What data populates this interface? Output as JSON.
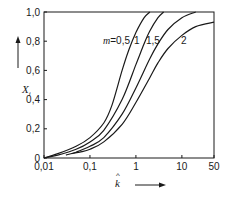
{
  "chart_data": {
    "type": "line",
    "title": "",
    "xlabel": "k̂",
    "ylabel": "X_i",
    "xscale": "log",
    "xlim": [
      0.01,
      50
    ],
    "ylim": [
      0,
      1.0
    ],
    "grid": false,
    "x_ticks": [
      "0,01",
      "0,1",
      "1",
      "10",
      "50"
    ],
    "y_ticks": [
      "0",
      "0,2",
      "0,4",
      "0,6",
      "0,8",
      "1,0"
    ],
    "legend": {
      "position": "inline",
      "prefix": "m ="
    },
    "series": [
      {
        "name": "m = 0,5",
        "label": "0,5",
        "x": [
          0.01,
          0.02,
          0.05,
          0.1,
          0.2,
          0.3,
          0.5,
          0.7,
          1.0,
          1.5,
          2.0
        ],
        "y": [
          0.0,
          0.03,
          0.08,
          0.14,
          0.24,
          0.36,
          0.6,
          0.74,
          0.86,
          0.96,
          1.0
        ]
      },
      {
        "name": "m = 1",
        "label": "1",
        "x": [
          0.01,
          0.02,
          0.05,
          0.1,
          0.2,
          0.5,
          1.0,
          1.5,
          2.0,
          3.0,
          4.0
        ],
        "y": [
          0.0,
          0.02,
          0.06,
          0.11,
          0.19,
          0.4,
          0.64,
          0.78,
          0.87,
          0.96,
          1.0
        ]
      },
      {
        "name": "m = 1,5",
        "label": "1,5",
        "x": [
          0.03,
          0.05,
          0.1,
          0.2,
          0.5,
          1.0,
          2.0,
          3.0,
          5.0,
          10.0,
          20.0
        ],
        "y": [
          0.02,
          0.04,
          0.08,
          0.14,
          0.3,
          0.48,
          0.68,
          0.78,
          0.88,
          0.96,
          1.0
        ]
      },
      {
        "name": "m = 2",
        "label": "2",
        "x": [
          0.04,
          0.06,
          0.1,
          0.2,
          0.5,
          1.0,
          2.0,
          3.0,
          5.0,
          10.0,
          20.0,
          50.0
        ],
        "y": [
          0.03,
          0.04,
          0.06,
          0.11,
          0.23,
          0.38,
          0.55,
          0.65,
          0.75,
          0.84,
          0.9,
          0.93
        ]
      }
    ]
  }
}
